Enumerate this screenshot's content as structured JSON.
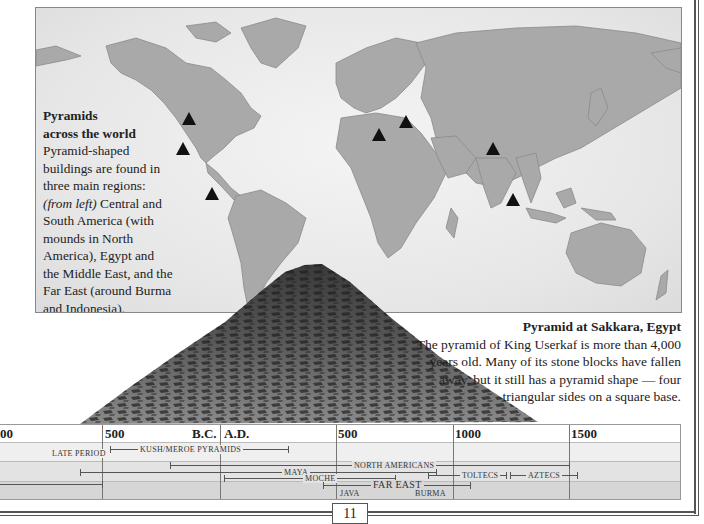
{
  "map": {
    "caption_title_line1": "Pyramids",
    "caption_title_line2": "across the world",
    "caption_body_1": "Pyramid-shaped buildings are found in three main regions: ",
    "caption_italic": "(from left)",
    "caption_body_2": " Central and South America (with mounds in North America), Egypt and the Middle East, and the Far East (around Burma and Indonesia).",
    "markers": [
      {
        "name": "north-america",
        "x": 188,
        "y": 118
      },
      {
        "name": "mexico",
        "x": 182,
        "y": 148
      },
      {
        "name": "peru",
        "x": 211,
        "y": 193
      },
      {
        "name": "egypt",
        "x": 378,
        "y": 134
      },
      {
        "name": "mesopotamia",
        "x": 405,
        "y": 121
      },
      {
        "name": "burma",
        "x": 492,
        "y": 148
      },
      {
        "name": "java",
        "x": 512,
        "y": 199
      }
    ],
    "marker_icon": "black-triangle"
  },
  "photo": {
    "caption_title": "Pyramid at Sakkara, Egypt",
    "caption_body": "The pyramid of King Userkaf is more than 4,000 years old. Many of its stone blocks have fallen away, but it still has a pyramid shape — four triangular sides on a square base."
  },
  "timeline": {
    "ticks": [
      {
        "label": "00",
        "x": 0
      },
      {
        "label": "500",
        "x": 103
      },
      {
        "label": "B.C.",
        "x": 192
      },
      {
        "label": "A.D.",
        "x": 224
      },
      {
        "label": "500",
        "x": 338
      },
      {
        "label": "1000",
        "x": 454
      },
      {
        "label": "1500",
        "x": 570
      }
    ],
    "bars": [
      {
        "label": "Late Period",
        "row": 1,
        "start": 0,
        "end": 102,
        "label_x": 50
      },
      {
        "label": "Kush/Meroe Pyramids",
        "row": 1,
        "start": 110,
        "end": 288,
        "label_x": 140
      },
      {
        "label": "North Americans",
        "row": 2,
        "start": 170,
        "end": 569,
        "label_x": 354
      },
      {
        "label": "Maya",
        "row": 2,
        "start": 80,
        "end": 436,
        "label_x": 283
      },
      {
        "label": "Moche",
        "row": 2,
        "start": 224,
        "end": 395,
        "label_x": 305
      },
      {
        "label": "Toltecs",
        "row": 2,
        "start": 428,
        "end": 506,
        "label_x": 462
      },
      {
        "label": "Aztecs",
        "row": 2,
        "start": 510,
        "end": 577,
        "label_x": 528
      },
      {
        "label": "Far East",
        "row": 3,
        "start": 323,
        "end": 470,
        "label_x": 373
      },
      {
        "label": "Java",
        "row": 3,
        "label_x": 339
      },
      {
        "label": "Burma",
        "row": 3,
        "label_x": 415
      }
    ]
  },
  "page": {
    "number": "11"
  }
}
